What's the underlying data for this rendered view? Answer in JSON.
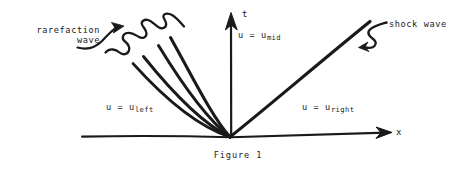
{
  "figure": {
    "caption": "Figure 1",
    "axes": {
      "t_label": "t",
      "x_label": "x"
    },
    "annotations": {
      "rarefaction_line1": "rarefaction",
      "rarefaction_line2": "wave",
      "shock": "shock wave"
    },
    "regions": {
      "mid_prefix": "u = u",
      "mid_sub": "mid",
      "left_prefix": "u = u",
      "left_sub": "left",
      "right_prefix": "u = u",
      "right_sub": "right"
    },
    "colors": {
      "ink": "#1a1a1a",
      "background": "#ffffff"
    }
  }
}
